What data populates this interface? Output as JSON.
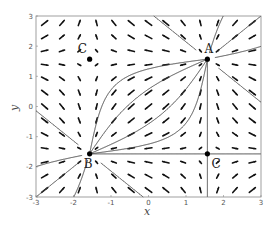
{
  "chart_data": {
    "type": "vector_field",
    "title": "",
    "xlabel": "x",
    "ylabel": "y",
    "xlim": [
      -3,
      3
    ],
    "ylim": [
      -3,
      3
    ],
    "xticks": [
      "-3",
      "-2",
      "-1",
      "0",
      "1",
      "2",
      "3"
    ],
    "yticks": [
      "-3",
      "-2",
      "-1",
      "0",
      "1",
      "2",
      "3"
    ],
    "grid": false,
    "field": {
      "u": "-cos(x)",
      "v": "-cos(y)",
      "grid_n": 13
    },
    "fixed_points": [
      {
        "label": "A",
        "x": 1.57,
        "y": 1.57,
        "kind": "unstable node"
      },
      {
        "label": "B",
        "x": -1.57,
        "y": -1.57,
        "kind": "stable node"
      },
      {
        "label": "C",
        "x": -1.57,
        "y": 1.57,
        "kind": "saddle"
      },
      {
        "label": "C",
        "x": 1.57,
        "y": -1.57,
        "kind": "saddle"
      }
    ],
    "colors": {
      "arrows": "#111111",
      "trajectories": "#444444",
      "frame": "#888888"
    }
  }
}
